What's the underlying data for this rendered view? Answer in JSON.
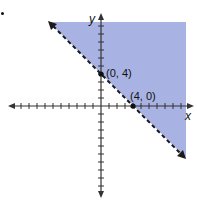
{
  "chart_data": {
    "type": "area",
    "title": "",
    "xlabel": "x",
    "ylabel": "y",
    "xlim": [
      -11,
      11
    ],
    "ylim": [
      -11,
      11
    ],
    "grid": false,
    "tick_step": 1,
    "boundary_line": {
      "equation": "x + y = 4",
      "style": "dashed",
      "points": [
        {
          "x": 0,
          "y": 4,
          "label": "(0, 4)"
        },
        {
          "x": 4,
          "y": 0,
          "label": "(4, 0)"
        }
      ]
    },
    "shaded_region": {
      "inequality": "x + y > 4",
      "side": "above-right",
      "color": "#a9b3e3"
    },
    "annotations": [
      "(0, 4)",
      "(4, 0)"
    ]
  },
  "labels": {
    "x_axis": "x",
    "y_axis": "y",
    "point_a": "(0, 4)",
    "point_b": "(4, 0)"
  },
  "colors": {
    "shade": "#a9b3e3",
    "line": "#1a1a1a",
    "axis": "#333333"
  }
}
